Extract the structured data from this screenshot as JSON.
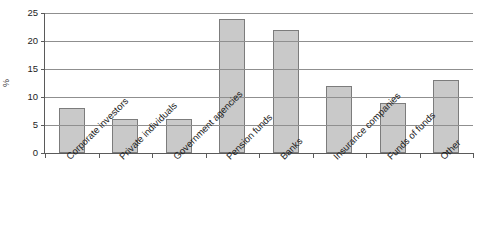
{
  "title_sliver": "",
  "chart_data": {
    "type": "bar",
    "title": "",
    "xlabel": "",
    "ylabel": "%",
    "ylim": [
      0,
      25
    ],
    "ytick_labels": [
      "25",
      "20",
      "15",
      "10",
      "5",
      "0"
    ],
    "yticks": [
      25,
      20,
      15,
      10,
      5,
      0
    ],
    "grid": true,
    "legend": "none",
    "categories": [
      "Corporate investors",
      "Private individuals",
      "Government agencies",
      "Pension funds",
      "Banks",
      "Insurance companies",
      "Funds of funds",
      "Other"
    ],
    "values": [
      8,
      6,
      6,
      24,
      22,
      12,
      9,
      13
    ],
    "bar_fill": "#c9c9c9",
    "bar_edge": "#7c7c7c",
    "axis_color": "#5a5a5a",
    "grid_color": "#8f8f8f"
  }
}
